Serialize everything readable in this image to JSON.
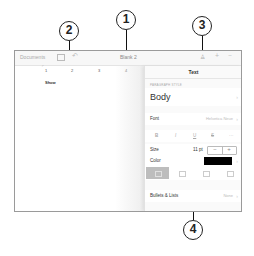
{
  "callouts": [
    {
      "id": "1",
      "label": "1"
    },
    {
      "id": "2",
      "label": "2"
    },
    {
      "id": "3",
      "label": "3"
    },
    {
      "id": "4",
      "label": "4"
    }
  ],
  "toolbar": {
    "documents_label": "Documents",
    "title": "Blank 2",
    "icons": [
      "sidebar-icon",
      "undo-icon",
      "format-brush-icon",
      "add-icon",
      "more-icon"
    ],
    "more_label": "···",
    "add_label": "+",
    "undo_label": "↶",
    "format_label": "♙"
  },
  "ruler": {
    "tabstop_label": "⌐",
    "marks": [
      "1",
      "2",
      "3",
      "4"
    ]
  },
  "document": {
    "text": "Show"
  },
  "panel": {
    "title": "Text",
    "section_label": "PARAGRAPH STYLE",
    "paragraph_style": "Body",
    "font": {
      "label": "Font",
      "value": "Helvetica Neue"
    },
    "format_buttons": [
      "B",
      "I",
      "U",
      "S",
      "···"
    ],
    "size": {
      "label": "Size",
      "value": "11 pt",
      "decrement": "−",
      "increment": "+"
    },
    "color": {
      "label": "Color",
      "value": "#000000"
    },
    "alignment": {
      "options": [
        "left",
        "center",
        "right",
        "justify"
      ],
      "selected": "left"
    },
    "bullets": {
      "label": "Bullets & Lists",
      "value": "None"
    },
    "chevron": "›"
  }
}
